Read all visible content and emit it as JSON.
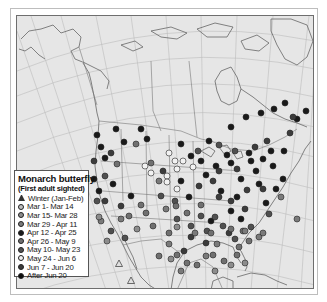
{
  "figure": {
    "type": "map",
    "region": "North America",
    "background_color": "#e6e6e6",
    "land_line_color": "#6a6a6a",
    "graticule_color": "#b9b9b9"
  },
  "legend": {
    "title": "Monarch butterfly",
    "subtitle": "(First adult sighted)",
    "items": [
      {
        "label": "Winter (Jan-Feb)",
        "marker": "triangle-icon",
        "color": "#d8d8d8"
      },
      {
        "label": "Mar 1- Mar 14",
        "marker": "circle-icon",
        "color": "#bdbdbd"
      },
      {
        "label": "Mar 15- Mar 28",
        "marker": "circle-icon",
        "color": "#8c8c8c"
      },
      {
        "label": "Mar 29 - Apr 11",
        "marker": "circle-icon",
        "color": "#7a7a7a"
      },
      {
        "label": "Apr 12 - Apr 25",
        "marker": "circle-icon",
        "color": "#1a1a1a"
      },
      {
        "label": "Apr 26 - May 9",
        "marker": "circle-icon",
        "color": "#707070"
      },
      {
        "label": "May 10- May 23",
        "marker": "circle-icon",
        "color": "#505050"
      },
      {
        "label": "May 24 - Jun 6",
        "marker": "circle-icon",
        "color": "#f2f2f2"
      },
      {
        "label": "Jun 7 - Jun 20",
        "marker": "circle-icon",
        "color": "#3c3c3c"
      },
      {
        "label": "After Jun 20",
        "marker": "circle-icon",
        "color": "#0d0d0d"
      }
    ]
  },
  "markers": {
    "winter_triangles": [
      [
        130,
        280
      ],
      [
        118,
        263
      ]
    ],
    "points": [
      {
        "c": "#1a1a1a",
        "p": [
          [
            115,
            128
          ],
          [
            140,
            128
          ],
          [
            123,
            141
          ],
          [
            100,
            146
          ],
          [
            96,
            134
          ],
          [
            104,
            157
          ],
          [
            93,
            178
          ],
          [
            98,
            190
          ],
          [
            112,
            183
          ],
          [
            130,
            195
          ],
          [
            146,
            138
          ],
          [
            180,
            143
          ],
          [
            208,
            140
          ],
          [
            230,
            126
          ],
          [
            245,
            116
          ],
          [
            260,
            112
          ],
          [
            273,
            108
          ],
          [
            284,
            102
          ],
          [
            296,
            118
          ],
          [
            305,
            110
          ],
          [
            180,
            180
          ],
          [
            188,
            196
          ],
          [
            205,
            174
          ],
          [
            215,
            165
          ],
          [
            230,
            162
          ],
          [
            250,
            160
          ],
          [
            262,
            158
          ],
          [
            240,
            178
          ],
          [
            220,
            190
          ],
          [
            236,
            196
          ],
          [
            258,
            183
          ],
          [
            200,
            160
          ],
          [
            190,
            155
          ],
          [
            226,
            154
          ],
          [
            248,
            152
          ],
          [
            270,
            150
          ],
          [
            255,
            170
          ],
          [
            230,
            210
          ],
          [
            210,
            220
          ],
          [
            240,
            218
          ],
          [
            265,
            202
          ],
          [
            275,
            188
          ],
          [
            282,
            178
          ],
          [
            272,
            165
          ],
          [
            283,
            150
          ]
        ]
      },
      {
        "c": "#3c3c3c",
        "p": [
          [
            110,
            152
          ],
          [
            93,
            160
          ],
          [
            104,
            200
          ],
          [
            120,
            205
          ],
          [
            162,
            170
          ],
          [
            198,
            185
          ],
          [
            212,
            180
          ],
          [
            246,
            189
          ],
          [
            228,
            232
          ],
          [
            183,
            250
          ],
          [
            205,
            242
          ],
          [
            190,
            236
          ],
          [
            218,
            196
          ],
          [
            266,
            140
          ],
          [
            289,
            132
          ],
          [
            292,
            116
          ],
          [
            254,
            146
          ],
          [
            244,
            208
          ],
          [
            230,
            200
          ],
          [
            218,
            170
          ],
          [
            236,
            168
          ],
          [
            262,
            188
          ]
        ]
      },
      {
        "c": "#505050",
        "p": [
          [
            104,
            175
          ],
          [
            96,
            200
          ],
          [
            110,
            230
          ],
          [
            124,
            237
          ],
          [
            200,
            215
          ],
          [
            176,
            218
          ],
          [
            214,
            216
          ],
          [
            206,
            230
          ],
          [
            190,
            225
          ],
          [
            234,
            238
          ],
          [
            222,
            225
          ],
          [
            250,
            226
          ],
          [
            268,
            213
          ],
          [
            174,
            200
          ],
          [
            160,
            195
          ],
          [
            234,
            150
          ],
          [
            218,
            144
          ],
          [
            197,
            150
          ]
        ]
      },
      {
        "c": "#707070",
        "p": [
          [
            135,
            143
          ],
          [
            150,
            162
          ],
          [
            116,
            163
          ],
          [
            140,
            204
          ],
          [
            152,
            225
          ],
          [
            200,
            204
          ],
          [
            186,
            212
          ],
          [
            175,
            205
          ],
          [
            168,
            232
          ],
          [
            176,
            254
          ],
          [
            186,
            262
          ],
          [
            196,
            264
          ],
          [
            210,
            232
          ],
          [
            230,
            228
          ],
          [
            242,
            230
          ],
          [
            248,
            240
          ],
          [
            238,
            246
          ],
          [
            236,
            254
          ],
          [
            212,
            254
          ],
          [
            223,
            260
          ],
          [
            158,
            255
          ],
          [
            145,
            212
          ],
          [
            128,
            215
          ]
        ]
      },
      {
        "c": "#7a7a7a",
        "p": [
          [
            120,
            218
          ],
          [
            100,
            220
          ],
          [
            158,
            180
          ],
          [
            165,
            208
          ],
          [
            194,
            232
          ],
          [
            216,
            243
          ],
          [
            244,
            230
          ],
          [
            258,
            236
          ],
          [
            168,
            243
          ],
          [
            180,
            270
          ],
          [
            205,
            255
          ],
          [
            280,
            196
          ],
          [
            296,
            218
          ],
          [
            262,
            232
          ]
        ]
      },
      {
        "c": "#8c8c8c",
        "p": [
          [
            136,
            228
          ],
          [
            106,
            240
          ],
          [
            98,
            216
          ],
          [
            170,
            258
          ],
          [
            176,
            226
          ],
          [
            214,
            270
          ],
          [
            244,
            262
          ],
          [
            230,
            264
          ]
        ]
      },
      {
        "c": "#f2f2f2",
        "p": [
          [
            144,
            165
          ],
          [
            168,
            152
          ],
          [
            174,
            160
          ],
          [
            166,
            175
          ],
          [
            176,
            168
          ],
          [
            150,
            172
          ],
          [
            182,
            160
          ],
          [
            192,
            166
          ],
          [
            176,
            188
          ],
          [
            166,
            181
          ]
        ]
      }
    ]
  }
}
